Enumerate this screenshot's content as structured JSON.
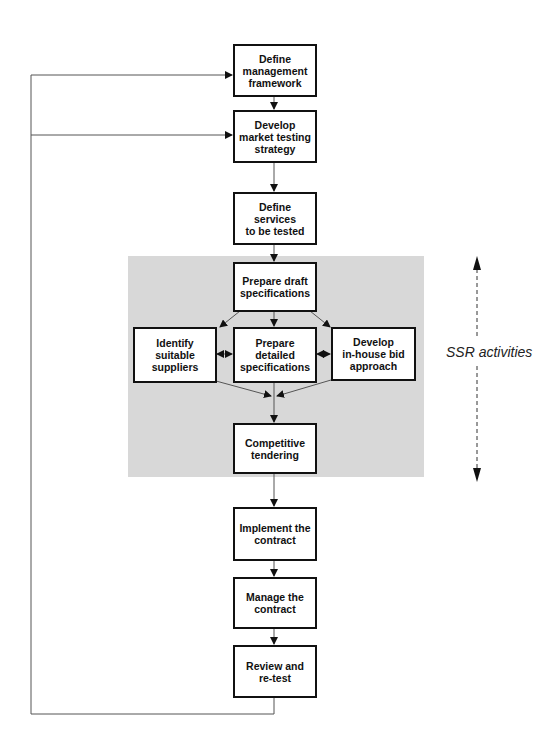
{
  "diagram": {
    "type": "flowchart",
    "panel_color": "#d8d8d8",
    "nodes": {
      "define_framework": "Define\nmanagement\nframework",
      "develop_strategy": "Develop\nmarket testing\nstrategy",
      "define_services": "Define services\nto be tested",
      "prepare_draft": "Prepare draft\nspecifications",
      "identify_suppliers": "Identify\nsuitable\nsuppliers",
      "prepare_detailed": "Prepare\ndetailed\nspecifications",
      "develop_bid": "Develop\nin-house bid\napproach",
      "competitive_tendering": "Competitive\ntendering",
      "implement_contract": "Implement the\ncontract",
      "manage_contract": "Manage the\ncontract",
      "review_retest": "Review and\nre-test"
    },
    "annotation": "SSR activities",
    "edges": [
      [
        "define_framework",
        "develop_strategy"
      ],
      [
        "develop_strategy",
        "define_services"
      ],
      [
        "define_services",
        "prepare_draft"
      ],
      [
        "prepare_draft",
        "identify_suppliers"
      ],
      [
        "prepare_draft",
        "prepare_detailed"
      ],
      [
        "prepare_draft",
        "develop_bid"
      ],
      [
        "identify_suppliers",
        "prepare_detailed",
        "bidirectional"
      ],
      [
        "prepare_detailed",
        "develop_bid",
        "bidirectional"
      ],
      [
        "identify_suppliers",
        "competitive_tendering"
      ],
      [
        "prepare_detailed",
        "competitive_tendering"
      ],
      [
        "develop_bid",
        "competitive_tendering"
      ],
      [
        "competitive_tendering",
        "implement_contract"
      ],
      [
        "implement_contract",
        "manage_contract"
      ],
      [
        "manage_contract",
        "review_retest"
      ],
      [
        "review_retest",
        "define_framework",
        "feedback"
      ],
      [
        "review_retest",
        "develop_strategy",
        "feedback"
      ]
    ]
  }
}
